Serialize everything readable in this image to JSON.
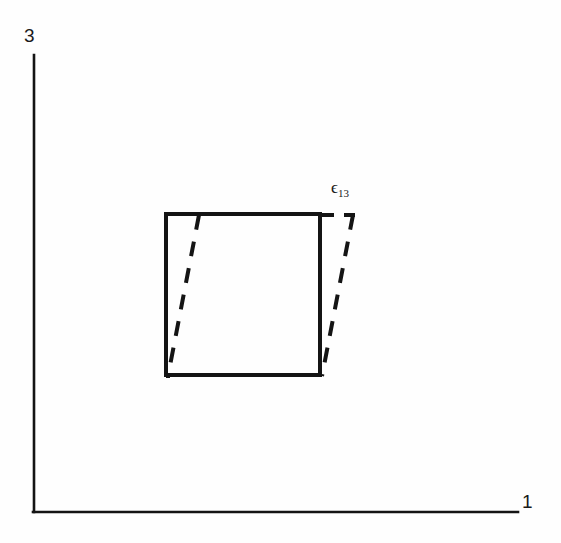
{
  "figure": {
    "type": "diagram",
    "background_color": "#fefefe",
    "line_color": "#141414",
    "width": 561,
    "height": 543
  },
  "axes": {
    "horizontal": {
      "name": "axis-1",
      "label": "1",
      "start": [
        34,
        512
      ],
      "end": [
        518,
        512
      ],
      "stroke_width": 2.6
    },
    "vertical": {
      "name": "axis-3",
      "label": "3",
      "start": [
        34,
        55
      ],
      "end": [
        34,
        512
      ],
      "stroke_width": 2.6
    }
  },
  "annotations": {
    "strain": {
      "symbol": "ϵ",
      "subscript": "13",
      "full_text": "ϵ13",
      "position": [
        331,
        179
      ]
    }
  },
  "shapes": {
    "undeformed_square": {
      "name": "undeformed-square",
      "style": "solid",
      "stroke_width": 4,
      "points": "166,214 320,214 320,375 166,375",
      "corners": {
        "top_left": [
          166,
          214
        ],
        "top_right": [
          320,
          214
        ],
        "bottom_right": [
          320,
          375
        ],
        "bottom_left": [
          166,
          375
        ]
      }
    },
    "deformed_parallelogram": {
      "name": "deformed-parallelogram",
      "style": "dashed",
      "stroke_width": 4,
      "dash_pattern": "14 11",
      "points": "199,215 353,215 322,375 168,375",
      "corners": {
        "top_left": [
          199,
          215
        ],
        "top_right": [
          353,
          215
        ],
        "bottom_right": [
          322,
          375
        ],
        "bottom_left": [
          168,
          375
        ]
      },
      "shear_offset_px": 32
    }
  }
}
